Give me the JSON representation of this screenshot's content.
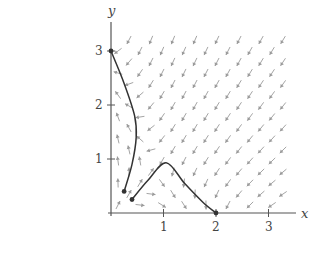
{
  "chart_data": {
    "type": "phase_portrait",
    "title": "",
    "xlabel": "x",
    "ylabel": "y",
    "xlim": [
      0,
      3.5
    ],
    "ylim": [
      0,
      3.5
    ],
    "x_ticks": [
      1,
      2,
      3
    ],
    "y_ticks": [
      1,
      2,
      3
    ],
    "x_tick_labels": [
      "1",
      "2",
      "3"
    ],
    "y_tick_labels": [
      "1",
      "2",
      "3"
    ],
    "grid": false,
    "vector_field": {
      "description": "direction field of a competing-species system; arrows up near y-axis, right along x-axis for x<2, left for x>2, down-left elsewhere",
      "equilibria": [
        [
          2,
          0
        ],
        [
          0,
          3
        ]
      ],
      "x_range": [
        0.1,
        3.4
      ],
      "y_range": [
        0.1,
        3.3
      ],
      "color": "#9a9a9a"
    },
    "trajectories": [
      {
        "name": "left-trajectory",
        "points": [
          [
            0.0,
            3.0
          ],
          [
            0.25,
            2.4
          ],
          [
            0.45,
            1.8
          ],
          [
            0.48,
            1.4
          ],
          [
            0.4,
            0.9
          ],
          [
            0.25,
            0.4
          ]
        ],
        "start_dot": [
          0.0,
          3.0
        ],
        "end_dot": [
          0.25,
          0.4
        ]
      },
      {
        "name": "right-trajectory",
        "points": [
          [
            0.4,
            0.25
          ],
          [
            0.7,
            0.6
          ],
          [
            1.05,
            0.93
          ],
          [
            1.4,
            0.55
          ],
          [
            1.75,
            0.2
          ],
          [
            2.0,
            0.0
          ]
        ],
        "start_dot": [
          0.4,
          0.25
        ],
        "end_dot": [
          2.0,
          0.0
        ]
      }
    ],
    "curve_color": "#333333"
  },
  "labels": {
    "x_axis": "x",
    "y_axis": "y",
    "tick_x_1": "1",
    "tick_x_2": "2",
    "tick_x_3": "3",
    "tick_y_1": "1",
    "tick_y_2": "2",
    "tick_y_3": "3"
  }
}
